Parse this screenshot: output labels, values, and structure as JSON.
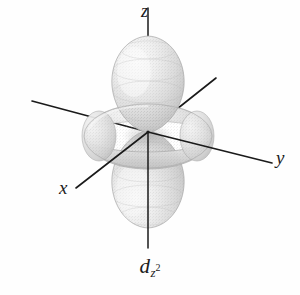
{
  "figure": {
    "name": "dz2-atomic-orbital-diagram",
    "kind": "3d-orbital-shape",
    "background_color": "#fefefe",
    "caption": {
      "base": "d",
      "subscript": "z",
      "superscript": "2",
      "full_text": "dz2"
    },
    "axes": {
      "origin": {
        "x": 148,
        "y": 132
      },
      "line_color": "#1a1a1a",
      "line_width": 1.6,
      "items": [
        {
          "id": "z-axis",
          "label": "z",
          "label_position": "top",
          "x1": 148,
          "y1": 8,
          "x2": 148,
          "y2": 248
        },
        {
          "id": "y-axis",
          "label": "y",
          "label_position": "right",
          "x1": 32,
          "y1": 101,
          "x2": 272,
          "y2": 163
        },
        {
          "id": "x-axis",
          "label": "x",
          "label_position": "lower-left",
          "x1": 76,
          "y1": 188,
          "x2": 216,
          "y2": 78
        }
      ]
    },
    "lobes": [
      {
        "id": "upper-z-lobe",
        "orientation": "up",
        "bounds": {
          "left": 111,
          "right": 186,
          "top": 34,
          "bottom": 133
        },
        "fill_light": "#f2f2f2",
        "fill_dark": "#bdbdbd"
      },
      {
        "id": "lower-z-lobe",
        "orientation": "down",
        "bounds": {
          "left": 111,
          "right": 186,
          "top": 131,
          "bottom": 229
        },
        "fill_light": "#f2f2f2",
        "fill_dark": "#bdbdbd"
      }
    ],
    "torus": {
      "id": "xy-plane-torus",
      "bounds": {
        "left": 84,
        "right": 213,
        "top": 104,
        "bottom": 169
      },
      "center": {
        "x": 148,
        "y": 136
      },
      "radius_x": 64,
      "radius_y": 32,
      "fill_light": "#ededed",
      "fill_dark": "#b4b4b4"
    }
  }
}
